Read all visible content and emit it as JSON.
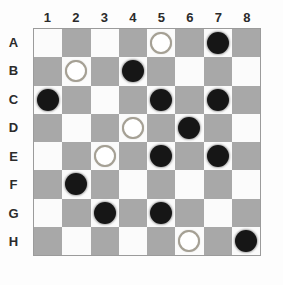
{
  "board": {
    "column_labels": [
      "1",
      "2",
      "3",
      "4",
      "5",
      "6",
      "7",
      "8"
    ],
    "row_labels": [
      "A",
      "B",
      "C",
      "D",
      "E",
      "F",
      "G",
      "H"
    ],
    "colors": {
      "light_square": "#fbfbfb",
      "dark_square": "#a8a8a8",
      "board_border": "#9b9b9b",
      "black_piece": "#161616",
      "white_piece_fill": "#ffffff",
      "white_piece_outline": "#a5a094",
      "label_color": "#2b2b2b",
      "page_background": "#fdfdfd"
    },
    "pieces": [
      {
        "square": "A5",
        "color": "white"
      },
      {
        "square": "A7",
        "color": "black"
      },
      {
        "square": "B2",
        "color": "white"
      },
      {
        "square": "B4",
        "color": "black"
      },
      {
        "square": "C1",
        "color": "black"
      },
      {
        "square": "C5",
        "color": "black"
      },
      {
        "square": "C7",
        "color": "black"
      },
      {
        "square": "D4",
        "color": "white"
      },
      {
        "square": "D6",
        "color": "black"
      },
      {
        "square": "E3",
        "color": "white"
      },
      {
        "square": "E5",
        "color": "black"
      },
      {
        "square": "E7",
        "color": "black"
      },
      {
        "square": "F2",
        "color": "black"
      },
      {
        "square": "G3",
        "color": "black"
      },
      {
        "square": "G5",
        "color": "black"
      },
      {
        "square": "H6",
        "color": "white"
      },
      {
        "square": "H8",
        "color": "black"
      }
    ]
  }
}
